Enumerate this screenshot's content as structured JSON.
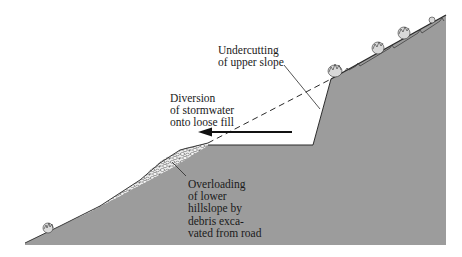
{
  "diagram": {
    "colors": {
      "background": "#ffffff",
      "terrain": "#9a9a9a",
      "terrain_edge": "#3a3a3a",
      "fill_debris": "#e8e8e8",
      "text": "#1a1a1a",
      "lines": "#1a1a1a"
    },
    "labels": {
      "undercutting": {
        "lines": [
          "Undercutting",
          "of upper slope"
        ]
      },
      "diversion": {
        "lines": [
          "Diversion",
          "of stormwater",
          "onto loose fill"
        ]
      },
      "overloading": {
        "lines": [
          "Overloading",
          "of lower",
          "hillslope by",
          "debris exca-",
          "vated from road"
        ]
      }
    },
    "elements": {
      "terrain": "hillslope cross-section (gray)",
      "road_bench": "flat road surface cut into slope",
      "cut_face": "steep excavated cut face",
      "original_slope": "dashed line showing original ground surface",
      "fill": "loose debris fill on lower slope",
      "arrow": "flow of stormwater directed left onto fill",
      "vegetation": [
        "shrub-lower-left",
        "shrub-cut-top",
        "shrub-upper-1",
        "shrub-upper-2",
        "shrub-upper-3"
      ]
    }
  }
}
